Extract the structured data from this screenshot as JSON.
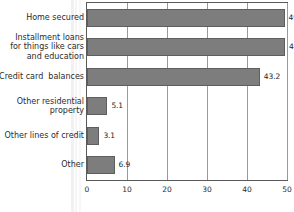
{
  "chart_data": {
    "type": "bar",
    "orientation": "horizontal",
    "title": "",
    "subtitle": "",
    "xlabel": "",
    "ylabel": "",
    "xlim": [
      0,
      50
    ],
    "xticks": [
      0,
      10,
      20,
      30,
      40,
      50
    ],
    "xtick_labels": [
      "0",
      "10",
      "20",
      "30",
      "40",
      "50"
    ],
    "grid": true,
    "grid_axis": "x",
    "legend": false,
    "legend_position": "none",
    "bar_color": "#7d7d7d",
    "bar_edge_color": "#5e5e5e",
    "frame_color": "#5a5a5a",
    "gridline_color": "#9a9a9a",
    "text_color": "#2b2b2b",
    "categories": [
      "Home secured",
      "Installment loans\nfor things like cars\nand education",
      "Credit card  balances",
      "Other residential\nproperty",
      "Other lines of credit",
      "Other"
    ],
    "values": [
      49.4,
      49.5,
      43.2,
      5.1,
      3.1,
      6.9
    ],
    "value_labels": [
      "49.4",
      "49.5",
      "43.2",
      "5.1",
      "3.1",
      "6.9"
    ],
    "bars": [
      {
        "category": "Home secured",
        "value": 49.4,
        "label": "49.4"
      },
      {
        "category": "Installment loans for things like cars and education",
        "value": 49.5,
        "label": "49.5"
      },
      {
        "category": "Credit card  balances",
        "value": 43.2,
        "label": "43.2"
      },
      {
        "category": "Other residential property",
        "value": 5.1,
        "label": "5.1"
      },
      {
        "category": "Other lines of credit",
        "value": 3.1,
        "label": "3.1"
      },
      {
        "category": "Other",
        "value": 6.9,
        "label": "6.9"
      }
    ]
  }
}
